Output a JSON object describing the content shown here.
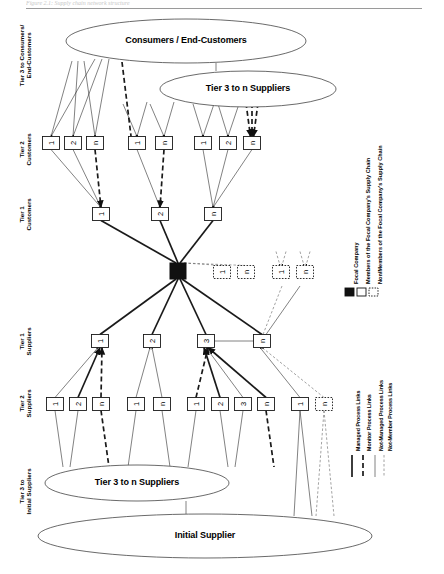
{
  "figure": {
    "caption_top": "Figure 2.1: Supply chain network structure",
    "source": "Source: Lambert, Cooper & Pagh (1998:7)"
  },
  "ellipses": [
    {
      "id": "consumers",
      "label": "Consumers / End-Customers",
      "cx": 186,
      "cy": 41,
      "rx": 120,
      "ry": 22
    },
    {
      "id": "tier3-n-suppliers-top",
      "label": "Tier 3 to n Suppliers",
      "cx": 248,
      "cy": 89,
      "rx": 88,
      "ry": 18
    },
    {
      "id": "tier3-n-suppliers-bottom",
      "label": "Tier 3 to n Suppliers",
      "cx": 137,
      "cy": 483,
      "rx": 92,
      "ry": 18
    },
    {
      "id": "initial-supplier",
      "label": "Initial Supplier",
      "cx": 205,
      "cy": 536,
      "rx": 167,
      "ry": 22
    }
  ],
  "tier_labels": [
    {
      "id": "tier3-consumers",
      "lines": [
        "Tier 3 to Consumers/",
        "End-Customers"
      ],
      "x": 20,
      "y": 56
    },
    {
      "id": "tier2-customers",
      "lines": [
        "Tier 2",
        "Customers"
      ],
      "x": 20,
      "y": 150
    },
    {
      "id": "tier1-customers",
      "lines": [
        "Tier 1",
        "Customers"
      ],
      "x": 20,
      "y": 215
    },
    {
      "id": "tier1-suppliers",
      "lines": [
        "Tier 1",
        "Suppliers"
      ],
      "x": 20,
      "y": 342
    },
    {
      "id": "tier2-suppliers",
      "lines": [
        "Tier 2",
        "Suppliers"
      ],
      "x": 20,
      "y": 404
    },
    {
      "id": "tier3-initial-suppliers",
      "lines": [
        "Tier 3 to",
        "Initial Suppliers"
      ],
      "x": 20,
      "y": 492
    }
  ],
  "nodes": {
    "tier2_customers": [
      {
        "label": "1",
        "x": 51,
        "y": 143,
        "style": "member"
      },
      {
        "label": "2",
        "x": 73,
        "y": 143,
        "style": "member"
      },
      {
        "label": "n",
        "x": 95,
        "y": 143,
        "style": "member"
      },
      {
        "label": "1",
        "x": 137,
        "y": 143,
        "style": "member"
      },
      {
        "label": "n",
        "x": 164,
        "y": 143,
        "style": "member"
      },
      {
        "label": "1",
        "x": 203,
        "y": 143,
        "style": "member"
      },
      {
        "label": "2",
        "x": 228,
        "y": 143,
        "style": "member"
      },
      {
        "label": "n",
        "x": 252,
        "y": 143,
        "style": "member"
      }
    ],
    "tier1_customers": [
      {
        "label": "1",
        "x": 101,
        "y": 214,
        "style": "member"
      },
      {
        "label": "2",
        "x": 160,
        "y": 214,
        "style": "member"
      },
      {
        "label": "n",
        "x": 213,
        "y": 214,
        "style": "member"
      }
    ],
    "focal_company": {
      "label": "",
      "x": 178,
      "y": 271,
      "style": "focal"
    },
    "non_members_customers": [
      {
        "label": "1",
        "x": 222,
        "y": 272,
        "style": "nonmember"
      },
      {
        "label": "n",
        "x": 246,
        "y": 272,
        "style": "nonmember"
      },
      {
        "label": "1",
        "x": 281,
        "y": 272,
        "style": "nonmember"
      },
      {
        "label": "n",
        "x": 305,
        "y": 272,
        "style": "nonmember"
      }
    ],
    "tier1_suppliers": [
      {
        "label": "1",
        "x": 100,
        "y": 341,
        "style": "member"
      },
      {
        "label": "2",
        "x": 152,
        "y": 341,
        "style": "member"
      },
      {
        "label": "3",
        "x": 206,
        "y": 341,
        "style": "member"
      },
      {
        "label": "n",
        "x": 262,
        "y": 341,
        "style": "member"
      }
    ],
    "tier2_suppliers": [
      {
        "label": "1",
        "x": 55,
        "y": 404,
        "style": "member"
      },
      {
        "label": "2",
        "x": 78,
        "y": 404,
        "style": "member"
      },
      {
        "label": "n",
        "x": 101,
        "y": 404,
        "style": "member"
      },
      {
        "label": "1",
        "x": 136,
        "y": 404,
        "style": "member"
      },
      {
        "label": "n",
        "x": 162,
        "y": 404,
        "style": "member"
      },
      {
        "label": "1",
        "x": 196,
        "y": 404,
        "style": "member"
      },
      {
        "label": "2",
        "x": 220,
        "y": 404,
        "style": "member"
      },
      {
        "label": "3",
        "x": 243,
        "y": 404,
        "style": "member"
      },
      {
        "label": "n",
        "x": 266,
        "y": 404,
        "style": "member"
      },
      {
        "label": "1",
        "x": 300,
        "y": 404,
        "style": "member"
      },
      {
        "label": "n",
        "x": 324,
        "y": 404,
        "style": "nonmember"
      }
    ]
  },
  "legend": {
    "entity_items": [
      {
        "id": "focal-company",
        "label": "Focal Company",
        "swatch": "filled-black"
      },
      {
        "id": "members",
        "label": "Members of the Focal Company's Supply Chain",
        "swatch": "outline-solid"
      },
      {
        "id": "non-members",
        "label": "Non/Members of the Focal Company's Supply Chain",
        "swatch": "outline-dotted"
      }
    ],
    "link_items": [
      {
        "id": "managed",
        "label": "Managed Process Links",
        "line": "thick-solid"
      },
      {
        "id": "monitor",
        "label": "Monitor Process Links",
        "line": "thick-dashed"
      },
      {
        "id": "not-managed",
        "label": "Not-Managed Process Links",
        "line": "thin-solid"
      },
      {
        "id": "not-member",
        "label": "Not-Member Process Links",
        "line": "thin-dashed"
      }
    ]
  },
  "colors": {
    "ink": "#000000",
    "stroke": "#1a1a1a",
    "focal_fill": "#111111",
    "ellipse_stroke": "#444444",
    "source_text": "#8d8d8d"
  }
}
